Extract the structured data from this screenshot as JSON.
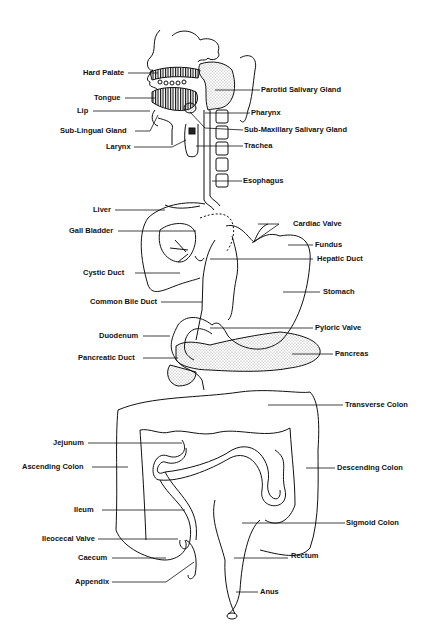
{
  "diagram": {
    "labels": {
      "hard_palate": "Hard Palate",
      "parotid": "Parotid Salivary Gland",
      "tongue": "Tongue",
      "lip": "Lip",
      "pharynx": "Pharynx",
      "sub_lingual": "Sub-Lingual Gland",
      "sub_maxillary": "Sub-Maxillary Salivary Gland",
      "larynx": "Larynx",
      "trachea": "Trachea",
      "esophagus": "Esophagus",
      "liver": "Liver",
      "cardiac_valve": "Cardiac Valve",
      "gall_bladder": "Gall Bladder",
      "fundus": "Fundus",
      "hepatic_duct": "Hepatic Duct",
      "cystic_duct": "Cystic Duct",
      "stomach": "Stomach",
      "common_bile_duct": "Common Bile Duct",
      "duodenum": "Duodenum",
      "pyloric_valve": "Pyloric Valve",
      "pancreatic_duct": "Pancreatic Duct",
      "pancreas": "Pancreas",
      "transverse_colon": "Transverse Colon",
      "jejunum": "Jejunum",
      "ascending_colon": "Ascending Colon",
      "descending_colon": "Descending Colon",
      "ileum": "Ileum",
      "sigmoid_colon": "Sigmoid Colon",
      "ileocecal_valve": "Ileocecal Valve",
      "caecum": "Caecum",
      "rectum": "Rectum",
      "appendix": "Appendix",
      "anus": "Anus"
    }
  }
}
